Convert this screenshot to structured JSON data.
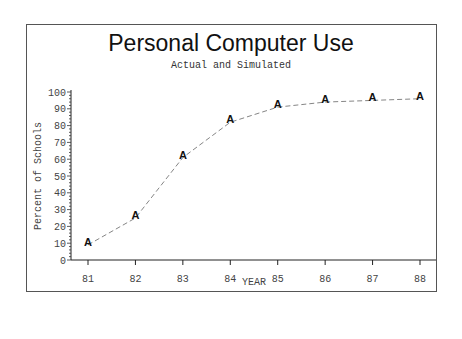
{
  "chart_data": {
    "type": "line",
    "title": "Personal Computer Use",
    "subtitle": "Actual and Simulated",
    "xlabel": "YEAR",
    "ylabel": "Percent of Schools",
    "categories": [
      "81",
      "82",
      "83",
      "84",
      "85",
      "86",
      "87",
      "88"
    ],
    "series": [
      {
        "name": "A",
        "marker": "A",
        "line_style": "dashed",
        "values": [
          9,
          25,
          61,
          82,
          91,
          94,
          95,
          96
        ]
      }
    ],
    "y_ticks": [
      0,
      10,
      20,
      30,
      40,
      50,
      60,
      70,
      80,
      90,
      100
    ],
    "ylim": [
      0,
      100
    ],
    "grid": false,
    "legend": "none"
  }
}
